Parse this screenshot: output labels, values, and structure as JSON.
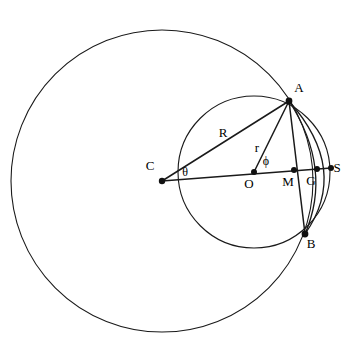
{
  "figure": {
    "width": 358,
    "height": 349,
    "background_color": "#ffffff",
    "stroke_color": "#1a1a1a"
  },
  "points": [
    {
      "id": "A",
      "label": "A",
      "x": 289,
      "y": 101,
      "label_x": 299,
      "label_y": 92,
      "dot": true
    },
    {
      "id": "B",
      "label": "B",
      "x": 305,
      "y": 234,
      "label_x": 311,
      "label_y": 248,
      "dot": true
    },
    {
      "id": "C",
      "label": "C",
      "x": 162,
      "y": 181,
      "label_x": 150,
      "label_y": 170,
      "dot": true
    },
    {
      "id": "O",
      "label": "O",
      "x": 254,
      "y": 172,
      "label_x": 249,
      "label_y": 188,
      "dot": true
    },
    {
      "id": "M",
      "label": "M",
      "x": 294,
      "y": 170,
      "label_x": 288,
      "label_y": 186,
      "dot": true
    },
    {
      "id": "G",
      "label": "G",
      "x": 317,
      "y": 169,
      "label_x": 311,
      "label_y": 185,
      "dot": true
    },
    {
      "id": "S",
      "label": "S",
      "x": 331,
      "y": 168,
      "label_x": 337,
      "label_y": 172,
      "dot": true
    }
  ],
  "circles": [
    {
      "id": "large-circle",
      "name": "large circle centred at C",
      "cx": 162,
      "cy": 181,
      "r": 151
    },
    {
      "id": "small-circle",
      "name": "small circle centred at O",
      "cx": 254,
      "cy": 172,
      "r": 76
    }
  ],
  "segments": [
    {
      "id": "C-A",
      "name": "radius R from C to A",
      "x1": 162,
      "y1": 181,
      "x2": 289,
      "y2": 101
    },
    {
      "id": "C-S",
      "name": "line from C through O to S",
      "x1": 162,
      "y1": 181,
      "x2": 331,
      "y2": 168
    },
    {
      "id": "O-A",
      "name": "radius r from O to A",
      "x1": 254,
      "y1": 172,
      "x2": 289,
      "y2": 101
    },
    {
      "id": "A-B",
      "name": "chord A to B through M",
      "x1": 289,
      "y1": 101,
      "x2": 305,
      "y2": 234
    }
  ],
  "arcs": [
    {
      "id": "arc-A-G-B",
      "name": "arc from A through G to B",
      "d": "M 289 101 Q 333 169 305 234"
    },
    {
      "id": "arc-A-S-B",
      "name": "arc from A through S to B",
      "d": "M 289 101 Q 350 170 305 234"
    }
  ],
  "measure_labels": [
    {
      "id": "R",
      "text": "R",
      "x": 223,
      "y": 137,
      "kind": "length"
    },
    {
      "id": "r",
      "text": "r",
      "x": 257,
      "y": 152,
      "kind": "length"
    },
    {
      "id": "theta",
      "text": "θ",
      "x": 185,
      "y": 176,
      "kind": "angle"
    },
    {
      "id": "phi",
      "text": "ϕ",
      "x": 266,
      "y": 165,
      "kind": "angle"
    }
  ]
}
